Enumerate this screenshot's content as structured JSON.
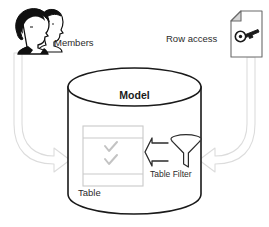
{
  "diagram": {
    "type": "concept-diagram",
    "nodes": {
      "members": {
        "label": "Members",
        "icon": "members-people-icon",
        "position": "top-left"
      },
      "row_access": {
        "label": "Row access",
        "icon": "document-key-icon",
        "position": "top-right"
      },
      "model": {
        "label": "Model",
        "icon": "database-cylinder-icon",
        "position": "center"
      },
      "table": {
        "label": "Table",
        "icon": "table-grid-icon",
        "rows": [
          "",
          "check",
          "check",
          ""
        ],
        "check_glyph": "✓"
      },
      "table_filter": {
        "label": "Table Filter",
        "icon": "funnel-icon",
        "arrow": "block-arrow-left"
      }
    },
    "connectors": [
      {
        "name": "members-to-model",
        "from": "members",
        "to": "model",
        "style": "curved-block-arrow",
        "direction": "down-right"
      },
      {
        "name": "rowaccess-to-model",
        "from": "row_access",
        "to": "model",
        "style": "curved-block-arrow",
        "direction": "down-left"
      },
      {
        "name": "filter-to-table",
        "from": "table_filter",
        "to": "table",
        "style": "block-arrow",
        "direction": "left"
      }
    ],
    "colors": {
      "outline": "#1a1a1a",
      "arrow_stroke": "#d8d8d8",
      "table_stroke": "#c9c9c9",
      "check": "#c0c0c0",
      "text": "#2b2b2b",
      "background": "#ffffff",
      "hair": "#101010",
      "face": "#ffffff"
    }
  }
}
